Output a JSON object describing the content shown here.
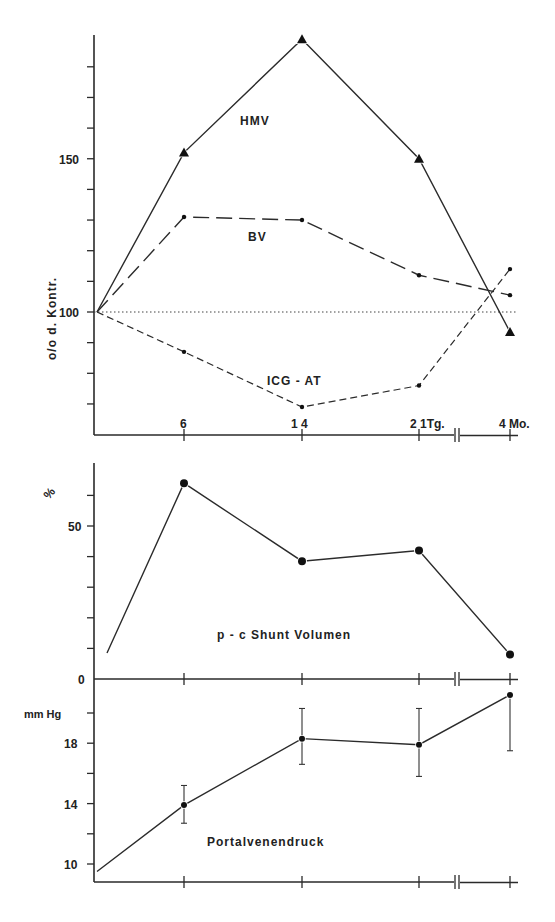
{
  "chart_data": [
    {
      "type": "line",
      "panel": "top",
      "title": "",
      "ylabel": "o/o d. Kontr.",
      "xlabel": "",
      "ylim": [
        60,
        190
      ],
      "yticks": [
        70,
        80,
        90,
        100,
        110,
        120,
        130,
        140,
        150,
        160,
        170,
        180
      ],
      "ytick_labels": [
        {
          "value": 150,
          "label": "150"
        },
        {
          "value": 100,
          "label": "100"
        }
      ],
      "x_tick_labels": [
        "6",
        "1 4",
        "2 1Tg.",
        "4 Mo."
      ],
      "x": [
        0,
        6,
        14,
        21,
        "4 Mo."
      ],
      "reference_line": {
        "y": 100,
        "style": "dotted"
      },
      "grid": false,
      "series": [
        {
          "name": "HMV",
          "marker": "triangle",
          "line": "solid",
          "values": [
            100,
            152,
            189,
            150,
            93.5
          ]
        },
        {
          "name": "BV",
          "marker": "dot",
          "line": "long-dash",
          "values": [
            100,
            131,
            130,
            112,
            105.5
          ]
        },
        {
          "name": "ICG - AT",
          "marker": "dot",
          "line": "short-dash",
          "values": [
            100,
            87,
            69,
            76,
            114
          ]
        }
      ]
    },
    {
      "type": "line",
      "panel": "middle",
      "title": "",
      "ylabel": "%",
      "ylim": [
        0,
        70
      ],
      "yticks": [
        10,
        20,
        30,
        40,
        50,
        60
      ],
      "ytick_labels": [
        {
          "value": 50,
          "label": "50"
        },
        {
          "value": 0,
          "label": "0"
        }
      ],
      "x": [
        0,
        6,
        14,
        21,
        "4 Mo."
      ],
      "grid": false,
      "series": [
        {
          "name": "p - c Shunt Volumen",
          "marker": "dot",
          "line": "solid",
          "values": [
            8.5,
            64,
            38.5,
            42,
            8
          ]
        }
      ]
    },
    {
      "type": "line",
      "panel": "bottom",
      "title": "",
      "ylabel": "mm Hg",
      "ylim": [
        9.2,
        21.5
      ],
      "yticks": [
        10,
        12,
        14,
        16,
        18,
        20
      ],
      "ytick_labels": [
        {
          "value": 18,
          "label": "18"
        },
        {
          "value": 14,
          "label": "14"
        },
        {
          "value": 10,
          "label": "10"
        }
      ],
      "x": [
        0,
        6,
        14,
        21,
        "4 Mo."
      ],
      "grid": false,
      "series": [
        {
          "name": "Portalvenendruck",
          "marker": "dot",
          "line": "solid",
          "values": [
            9.5,
            13.9,
            18.3,
            17.9,
            21.2
          ],
          "error_low": [
            null,
            12.7,
            16.6,
            15.8,
            17.5
          ],
          "error_high": [
            null,
            15.2,
            20.3,
            20.3,
            null
          ]
        }
      ]
    }
  ],
  "labels": {
    "top_ylabel": "o/o d. Kontr.",
    "hmv": "HMV",
    "bv": "BV",
    "icg": "ICG - AT",
    "mid_ylabel": "%",
    "shunt": "p - c Shunt Volumen",
    "bot_ylabel": "mm Hg",
    "portal": "Portalvenendruck",
    "x6": "6",
    "x14": "1 4",
    "x21": "2 1Tg.",
    "x4mo": "4 Mo.",
    "y150": "150",
    "y100": "100",
    "y50": "50",
    "y0": "0",
    "y18": "18",
    "y14": "14",
    "y10": "10"
  },
  "layout": {
    "x_pixels": [
      97,
      184,
      302,
      419,
      510
    ],
    "break_x": 457,
    "axis_x": 94,
    "axis_right": 518,
    "top": {
      "y0_val": 100,
      "y0_px": 312,
      "px_per_unit": 3.065,
      "axis_top": 35,
      "axis_bottom": 435
    },
    "middle": {
      "y0_val": 0,
      "y0_px": 679,
      "px_per_unit": 3.06,
      "axis_top": 463,
      "axis_bottom": 679
    },
    "bottom": {
      "y0_val": 10,
      "y0_px": 864,
      "px_per_unit": 15.1,
      "axis_top": 679,
      "axis_bottom": 882
    }
  }
}
